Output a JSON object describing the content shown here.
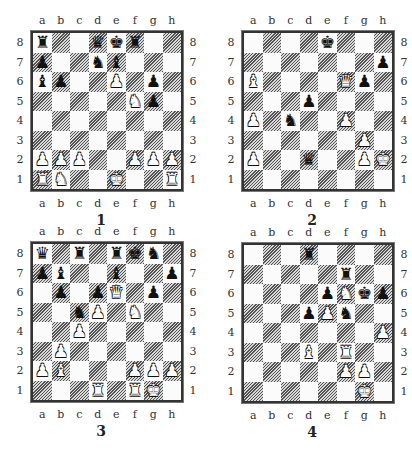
{
  "files": [
    "a",
    "b",
    "c",
    "d",
    "e",
    "f",
    "g",
    "h"
  ],
  "ranks": [
    "8",
    "7",
    "6",
    "5",
    "4",
    "3",
    "2",
    "1"
  ],
  "piece_glyphs": {
    "K": "♚",
    "Q": "♛",
    "R": "♜",
    "B": "♝",
    "N": "♞",
    "P": "♟"
  },
  "diagrams": [
    {
      "number": "1",
      "pieces": [
        {
          "sq": "a8",
          "color": "b",
          "type": "R"
        },
        {
          "sq": "d8",
          "color": "b",
          "type": "Q"
        },
        {
          "sq": "e8",
          "color": "b",
          "type": "K"
        },
        {
          "sq": "f8",
          "color": "b",
          "type": "R"
        },
        {
          "sq": "a7",
          "color": "b",
          "type": "P"
        },
        {
          "sq": "d7",
          "color": "b",
          "type": "N"
        },
        {
          "sq": "e7",
          "color": "b",
          "type": "B"
        },
        {
          "sq": "a6",
          "color": "b",
          "type": "B"
        },
        {
          "sq": "b6",
          "color": "b",
          "type": "P"
        },
        {
          "sq": "g6",
          "color": "b",
          "type": "P"
        },
        {
          "sq": "g5",
          "color": "b",
          "type": "P"
        },
        {
          "sq": "e6",
          "color": "w",
          "type": "P"
        },
        {
          "sq": "f5",
          "color": "w",
          "type": "N"
        },
        {
          "sq": "a2",
          "color": "w",
          "type": "P"
        },
        {
          "sq": "b2",
          "color": "w",
          "type": "P"
        },
        {
          "sq": "c2",
          "color": "w",
          "type": "P"
        },
        {
          "sq": "f2",
          "color": "w",
          "type": "P"
        },
        {
          "sq": "g2",
          "color": "w",
          "type": "P"
        },
        {
          "sq": "h2",
          "color": "w",
          "type": "P"
        },
        {
          "sq": "a1",
          "color": "w",
          "type": "R"
        },
        {
          "sq": "b1",
          "color": "w",
          "type": "N"
        },
        {
          "sq": "e1",
          "color": "w",
          "type": "K"
        },
        {
          "sq": "h1",
          "color": "w",
          "type": "R"
        }
      ]
    },
    {
      "number": "2",
      "pieces": [
        {
          "sq": "e8",
          "color": "b",
          "type": "K"
        },
        {
          "sq": "h7",
          "color": "b",
          "type": "P"
        },
        {
          "sq": "g6",
          "color": "b",
          "type": "P"
        },
        {
          "sq": "d5",
          "color": "b",
          "type": "P"
        },
        {
          "sq": "c4",
          "color": "b",
          "type": "N"
        },
        {
          "sq": "d2",
          "color": "b",
          "type": "Q"
        },
        {
          "sq": "a6",
          "color": "w",
          "type": "B"
        },
        {
          "sq": "f6",
          "color": "w",
          "type": "Q"
        },
        {
          "sq": "a4",
          "color": "w",
          "type": "P"
        },
        {
          "sq": "f4",
          "color": "w",
          "type": "P"
        },
        {
          "sq": "g3",
          "color": "w",
          "type": "P"
        },
        {
          "sq": "a2",
          "color": "w",
          "type": "P"
        },
        {
          "sq": "g2",
          "color": "w",
          "type": "P"
        },
        {
          "sq": "h2",
          "color": "w",
          "type": "K"
        }
      ]
    },
    {
      "number": "3",
      "pieces": [
        {
          "sq": "a8",
          "color": "b",
          "type": "Q"
        },
        {
          "sq": "c8",
          "color": "b",
          "type": "R"
        },
        {
          "sq": "e8",
          "color": "b",
          "type": "R"
        },
        {
          "sq": "f8",
          "color": "b",
          "type": "K"
        },
        {
          "sq": "g8",
          "color": "b",
          "type": "N"
        },
        {
          "sq": "a7",
          "color": "b",
          "type": "P"
        },
        {
          "sq": "b7",
          "color": "b",
          "type": "B"
        },
        {
          "sq": "e7",
          "color": "b",
          "type": "B"
        },
        {
          "sq": "h7",
          "color": "b",
          "type": "P"
        },
        {
          "sq": "b6",
          "color": "b",
          "type": "P"
        },
        {
          "sq": "d6",
          "color": "b",
          "type": "P"
        },
        {
          "sq": "g6",
          "color": "b",
          "type": "P"
        },
        {
          "sq": "c5",
          "color": "b",
          "type": "N"
        },
        {
          "sq": "e6",
          "color": "w",
          "type": "Q"
        },
        {
          "sq": "d5",
          "color": "w",
          "type": "P"
        },
        {
          "sq": "f5",
          "color": "w",
          "type": "N"
        },
        {
          "sq": "c4",
          "color": "w",
          "type": "P"
        },
        {
          "sq": "b3",
          "color": "w",
          "type": "P"
        },
        {
          "sq": "a2",
          "color": "w",
          "type": "P"
        },
        {
          "sq": "b2",
          "color": "w",
          "type": "B"
        },
        {
          "sq": "f2",
          "color": "w",
          "type": "P"
        },
        {
          "sq": "g2",
          "color": "w",
          "type": "P"
        },
        {
          "sq": "h2",
          "color": "w",
          "type": "P"
        },
        {
          "sq": "d1",
          "color": "w",
          "type": "R"
        },
        {
          "sq": "f1",
          "color": "w",
          "type": "R"
        },
        {
          "sq": "g1",
          "color": "w",
          "type": "K"
        }
      ]
    },
    {
      "number": "4",
      "pieces": [
        {
          "sq": "d8",
          "color": "b",
          "type": "R"
        },
        {
          "sq": "f7",
          "color": "b",
          "type": "R"
        },
        {
          "sq": "e6",
          "color": "b",
          "type": "P"
        },
        {
          "sq": "g6",
          "color": "b",
          "type": "K"
        },
        {
          "sq": "h6",
          "color": "b",
          "type": "P"
        },
        {
          "sq": "d5",
          "color": "b",
          "type": "P"
        },
        {
          "sq": "f5",
          "color": "b",
          "type": "N"
        },
        {
          "sq": "f6",
          "color": "w",
          "type": "N"
        },
        {
          "sq": "e5",
          "color": "w",
          "type": "P"
        },
        {
          "sq": "h4",
          "color": "w",
          "type": "P"
        },
        {
          "sq": "d3",
          "color": "w",
          "type": "B"
        },
        {
          "sq": "f3",
          "color": "w",
          "type": "R"
        },
        {
          "sq": "f2",
          "color": "w",
          "type": "P"
        },
        {
          "sq": "g2",
          "color": "w",
          "type": "P"
        },
        {
          "sq": "g1",
          "color": "w",
          "type": "K"
        }
      ]
    }
  ]
}
